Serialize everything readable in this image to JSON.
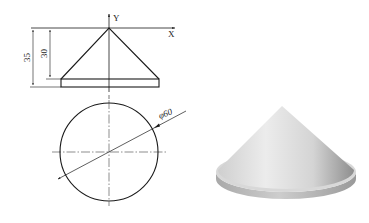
{
  "figure": {
    "front_view": {
      "axis_x_label": "X",
      "axis_y_label": "Y",
      "dimensions": [
        {
          "name": "total-height",
          "value": "35"
        },
        {
          "name": "cone-height",
          "value": "30"
        }
      ]
    },
    "top_view": {
      "diameter_label": "φ60"
    },
    "render_3d": {
      "shape": "cone with disk base",
      "color_light": "#e6e6e6",
      "color_dark": "#8e8e8e"
    },
    "colors": {
      "line": "#1a1a1a",
      "background": "#ffffff"
    }
  }
}
